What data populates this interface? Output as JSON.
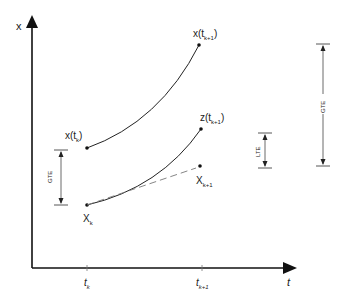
{
  "diagram": {
    "axes": {
      "y_label": "x",
      "x_label": "t",
      "x_ticks": [
        {
          "base": "t",
          "sub": "k"
        },
        {
          "base": "t",
          "sub": "k+1"
        }
      ]
    },
    "points": {
      "exact_start": {
        "base": "x(t",
        "sub": "k",
        "close": ")"
      },
      "exact_end": {
        "base": "x(t",
        "sub": "k+1",
        "close": ")"
      },
      "local_end": {
        "base": "z(t",
        "sub": "k+1",
        "close": ")"
      },
      "numeric_start": {
        "base": "X",
        "sub": "k"
      },
      "numeric_end": {
        "base": "X",
        "sub": "k+1"
      }
    },
    "error_markers": {
      "gte_left": "GTE",
      "lte": "LTE",
      "gte_right": "GTE"
    },
    "colors": {
      "line": "#222222",
      "dashed": "#777777",
      "error_bar": "#444444"
    }
  }
}
